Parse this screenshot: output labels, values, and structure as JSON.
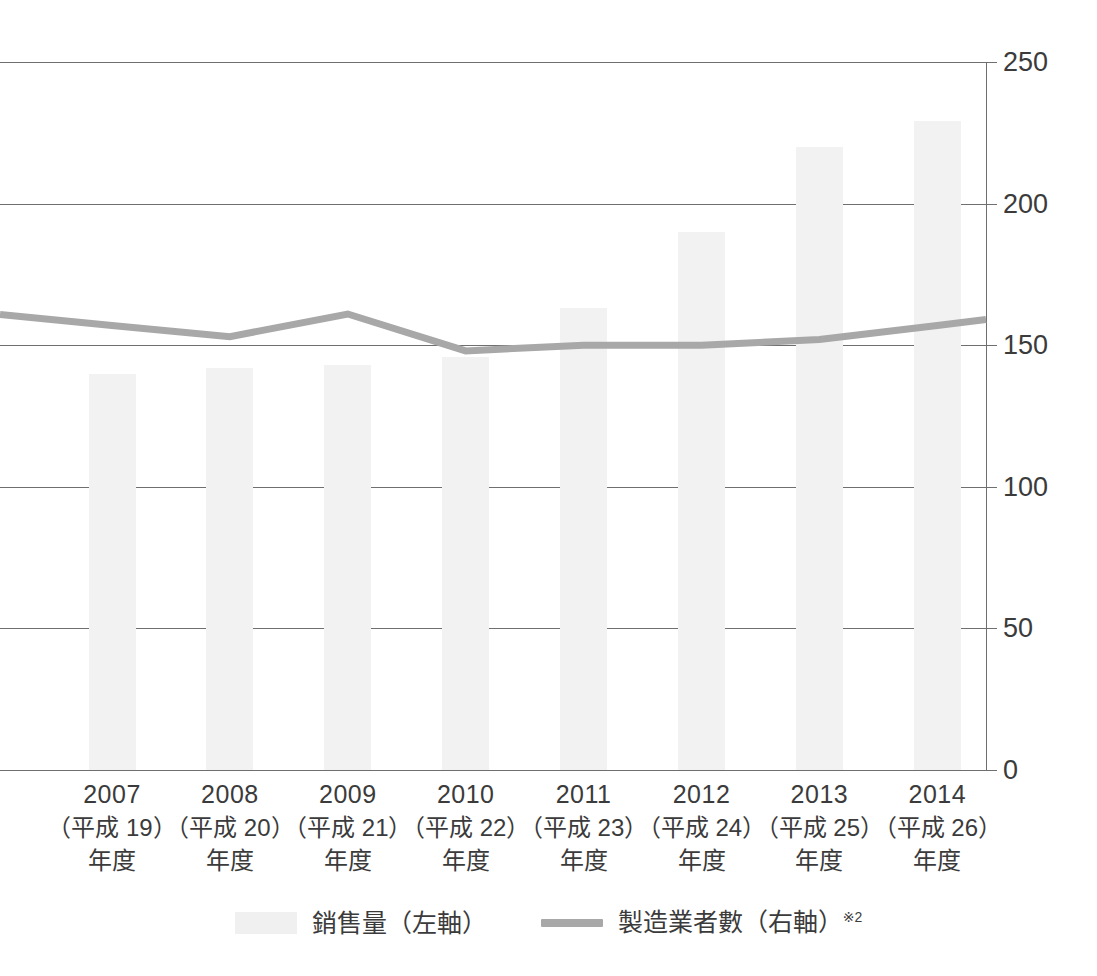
{
  "chart_data": {
    "type": "bar",
    "title": "",
    "subtitle": "",
    "xlabel": "",
    "ylabel": "",
    "categories": [
      "2007",
      "2008",
      "2009",
      "2010",
      "2011",
      "2012",
      "2013",
      "2014"
    ],
    "category_sublabels": [
      "（平成 19）",
      "（平成 20）",
      "（平成 21）",
      "（平成 22）",
      "（平成 23）",
      "（平成 24）",
      "（平成 25）",
      "（平成 26）"
    ],
    "category_unit_labels": [
      "年度",
      "年度",
      "年度",
      "年度",
      "年度",
      "年度",
      "年度",
      "年度"
    ],
    "grid": true,
    "legend_position": "bottom",
    "yaxis_right": {
      "ticks": [
        "0",
        "50",
        "100",
        "150",
        "200",
        "250"
      ],
      "tick_values": [
        0,
        50,
        100,
        150,
        200,
        250
      ],
      "ylim": [
        0,
        250
      ]
    },
    "series": [
      {
        "name": "銷售量（左軸）",
        "type": "bar",
        "axis": "left",
        "color": "#f2f2f2",
        "values": [
          140,
          142,
          143,
          146,
          163,
          190,
          220,
          229
        ]
      },
      {
        "name": "製造業者數（右軸）",
        "type": "line",
        "axis": "right",
        "color": "#a8a8a8",
        "note": "※2",
        "values": [
          157,
          153,
          161,
          148,
          150,
          150,
          152,
          157
        ]
      }
    ]
  },
  "legend": {
    "bar_label": "銷售量（左軸）",
    "line_label": "製造業者數（右軸）",
    "line_note": "※2"
  },
  "yticks": {
    "t250": "250",
    "t200": "200",
    "t150": "150",
    "t100": "100",
    "t50": "50",
    "t0": "0"
  }
}
